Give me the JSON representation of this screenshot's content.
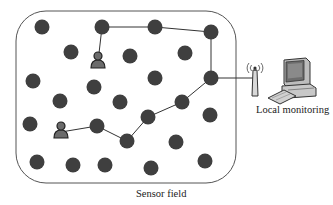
{
  "diagram": {
    "field_label": "Sensor field",
    "monitor_label": "Local monitoring",
    "colors": {
      "node": "#3f3f3f",
      "border": "#555555",
      "link": "#333333",
      "user_body": "#6b6b6b"
    },
    "nodes": [
      {
        "id": "n1",
        "x": 42,
        "y": 27
      },
      {
        "id": "n2",
        "x": 102,
        "y": 27
      },
      {
        "id": "n3",
        "x": 155,
        "y": 27
      },
      {
        "id": "n4",
        "x": 211,
        "y": 32
      },
      {
        "id": "n5",
        "x": 71,
        "y": 52
      },
      {
        "id": "n6",
        "x": 130,
        "y": 56
      },
      {
        "id": "n7",
        "x": 185,
        "y": 53
      },
      {
        "id": "n8",
        "x": 33,
        "y": 81
      },
      {
        "id": "n9",
        "x": 94,
        "y": 87
      },
      {
        "id": "n10",
        "x": 155,
        "y": 78
      },
      {
        "id": "n11",
        "x": 211,
        "y": 78
      },
      {
        "id": "n12",
        "x": 60,
        "y": 101
      },
      {
        "id": "n13",
        "x": 120,
        "y": 102
      },
      {
        "id": "n14",
        "x": 182,
        "y": 102
      },
      {
        "id": "n15",
        "x": 30,
        "y": 124
      },
      {
        "id": "n16",
        "x": 97,
        "y": 126
      },
      {
        "id": "n17",
        "x": 148,
        "y": 117
      },
      {
        "id": "n18",
        "x": 210,
        "y": 115
      },
      {
        "id": "n19",
        "x": 127,
        "y": 141
      },
      {
        "id": "n20",
        "x": 176,
        "y": 142
      },
      {
        "id": "n21",
        "x": 37,
        "y": 162
      },
      {
        "id": "n22",
        "x": 73,
        "y": 165
      },
      {
        "id": "n23",
        "x": 105,
        "y": 165
      },
      {
        "id": "n24",
        "x": 151,
        "y": 168
      },
      {
        "id": "n25",
        "x": 205,
        "y": 161
      }
    ],
    "users": [
      {
        "id": "user-top",
        "x": 98,
        "y": 62
      },
      {
        "id": "user-bottom",
        "x": 61,
        "y": 132
      }
    ],
    "links": [
      [
        "user-top",
        "n2"
      ],
      [
        "n2",
        "n3"
      ],
      [
        "n3",
        "n4"
      ],
      [
        "n4",
        "n11"
      ],
      [
        "user-bottom",
        "n16"
      ],
      [
        "n16",
        "n19"
      ],
      [
        "n19",
        "n17"
      ],
      [
        "n17",
        "n14"
      ],
      [
        "n14",
        "n11"
      ],
      [
        "n11",
        "antenna"
      ]
    ],
    "antenna": {
      "x": 255,
      "y": 78
    },
    "computer": {
      "x": 290,
      "y": 78
    }
  }
}
